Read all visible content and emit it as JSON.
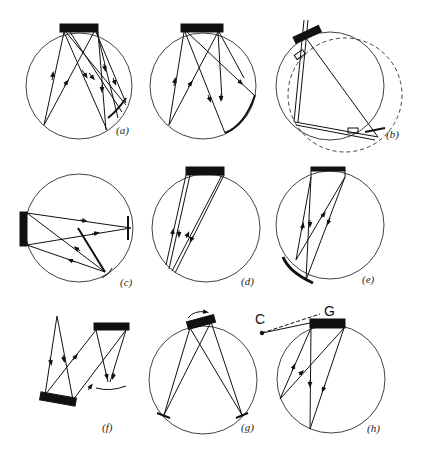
{
  "figure": {
    "panels": [
      {
        "id": "a",
        "label": "(a)"
      },
      {
        "id": "b",
        "label": "(b)"
      },
      {
        "id": "c",
        "label": "(c)"
      },
      {
        "id": "d",
        "label": "(d)"
      },
      {
        "id": "e",
        "label": "(e)"
      },
      {
        "id": "f",
        "label": "(f)"
      },
      {
        "id": "g",
        "label": "(g)"
      },
      {
        "id": "h",
        "label": "(h)"
      }
    ],
    "annotations": {
      "center_label": "C",
      "grating_label": "G"
    },
    "colors": {
      "ink": "#111111",
      "background": "#ffffff"
    }
  }
}
